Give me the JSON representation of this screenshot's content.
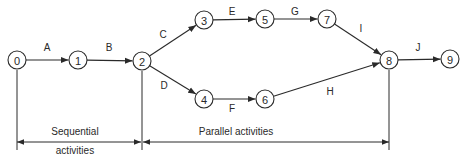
{
  "diagram": {
    "type": "activity-on-arrow network",
    "nodes": [
      {
        "id": "0",
        "label": "0",
        "x": 17,
        "y": 60
      },
      {
        "id": "1",
        "label": "1",
        "x": 78,
        "y": 60
      },
      {
        "id": "2",
        "label": "2",
        "x": 142,
        "y": 61
      },
      {
        "id": "3",
        "label": "3",
        "x": 204,
        "y": 20
      },
      {
        "id": "4",
        "label": "4",
        "x": 204,
        "y": 99
      },
      {
        "id": "5",
        "label": "5",
        "x": 265,
        "y": 19
      },
      {
        "id": "6",
        "label": "6",
        "x": 265,
        "y": 99
      },
      {
        "id": "7",
        "label": "7",
        "x": 327,
        "y": 19
      },
      {
        "id": "8",
        "label": "8",
        "x": 389,
        "y": 60
      },
      {
        "id": "9",
        "label": "9",
        "x": 450,
        "y": 59
      }
    ],
    "edges": [
      {
        "from": "0",
        "to": "1",
        "label": "A",
        "lx": 47,
        "ly": 51
      },
      {
        "from": "1",
        "to": "2",
        "label": "B",
        "lx": 109,
        "ly": 51
      },
      {
        "from": "2",
        "to": "3",
        "label": "C",
        "lx": 163,
        "ly": 38
      },
      {
        "from": "2",
        "to": "4",
        "label": "D",
        "lx": 164,
        "ly": 89
      },
      {
        "from": "3",
        "to": "5",
        "label": "E",
        "lx": 232,
        "ly": 15
      },
      {
        "from": "4",
        "to": "6",
        "label": "F",
        "lx": 232,
        "ly": 112
      },
      {
        "from": "5",
        "to": "7",
        "label": "G",
        "lx": 295,
        "ly": 15
      },
      {
        "from": "7",
        "to": "8",
        "label": "I",
        "lx": 361,
        "ly": 32
      },
      {
        "from": "6",
        "to": "8",
        "label": "H",
        "lx": 330,
        "ly": 95
      },
      {
        "from": "8",
        "to": "9",
        "label": "J",
        "lx": 418,
        "ly": 51
      }
    ],
    "annotations": {
      "sequential": {
        "line1": "Sequential",
        "line2": "activities",
        "from_node": "0",
        "to_node": "2"
      },
      "parallel": {
        "text": "Parallel activities",
        "from_node": "2",
        "to_node": "8"
      }
    },
    "colors": {
      "stroke": "#2a2a2a",
      "background": "#ffffff"
    }
  }
}
